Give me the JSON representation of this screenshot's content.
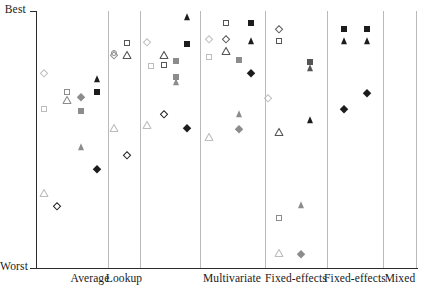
{
  "figure": {
    "type": "strip-plot",
    "background": "#ffffff"
  },
  "axes": {
    "y_top_label": "Best",
    "y_bottom_label": "Worst",
    "y_axis_note": "ordinal rank axis, no numeric ticks",
    "x_axis_note": "categorical panels"
  },
  "panels": [
    {
      "label": "Average"
    },
    {
      "label": "Lookup"
    },
    {
      "label": "Multivariate"
    },
    {
      "label": "Fixed-effects"
    },
    {
      "label": "Fixed-effects"
    },
    {
      "label": "Mixed"
    }
  ],
  "colors": {
    "black": "#1c1c1c",
    "dark_gray": "#555555",
    "mid_gray": "#8c8c8c",
    "light_gray": "#bdbdbd",
    "axis": "#2b2b2b",
    "divider": "#b9b9b9"
  },
  "chart_data": {
    "type": "scatter",
    "title": "",
    "xlabel": "",
    "ylabel": "",
    "ylim": [
      0,
      1
    ],
    "y_tick_labels": [
      "Best",
      "Worst"
    ],
    "y_tick_values": [
      1,
      0
    ],
    "grid": false,
    "legend": "none",
    "categories": [
      "Average",
      "Lookup",
      "Multivariate",
      "Fixed-effects",
      "Fixed-effects",
      "Mixed"
    ],
    "marker_shapes": [
      "diamond",
      "square",
      "triangle",
      "circle"
    ],
    "marker_fills": [
      "open",
      "filled"
    ],
    "note": "Each point is a method ranked from Best (top) to Worst (bottom) within a panel. x is jitter position inside the panel, y is rank score 0..1.",
    "points": [
      {
        "panel": "Average",
        "shape": "diamond",
        "fill": "open",
        "color": "light_gray",
        "x": 0.1,
        "y": 0.76
      },
      {
        "panel": "Average",
        "shape": "square",
        "fill": "open",
        "color": "mid_gray",
        "x": 0.42,
        "y": 0.684
      },
      {
        "panel": "Average",
        "shape": "triangle",
        "fill": "open",
        "color": "mid_gray",
        "x": 0.42,
        "y": 0.655
      },
      {
        "panel": "Average",
        "shape": "square",
        "fill": "open",
        "color": "light_gray",
        "x": 0.1,
        "y": 0.62
      },
      {
        "panel": "Average",
        "shape": "diamond",
        "fill": "filled",
        "color": "mid_gray",
        "x": 0.62,
        "y": 0.665
      },
      {
        "panel": "Average",
        "shape": "square",
        "fill": "filled",
        "color": "mid_gray",
        "x": 0.62,
        "y": 0.61
      },
      {
        "panel": "Average",
        "shape": "triangle",
        "fill": "filled",
        "color": "black",
        "x": 0.84,
        "y": 0.735
      },
      {
        "panel": "Average",
        "shape": "square",
        "fill": "filled",
        "color": "black",
        "x": 0.84,
        "y": 0.685
      },
      {
        "panel": "Average",
        "shape": "triangle",
        "fill": "filled",
        "color": "mid_gray",
        "x": 0.62,
        "y": 0.47
      },
      {
        "panel": "Average",
        "shape": "diamond",
        "fill": "filled",
        "color": "black",
        "x": 0.84,
        "y": 0.385
      },
      {
        "panel": "Average",
        "shape": "triangle",
        "fill": "open",
        "color": "light_gray",
        "x": 0.1,
        "y": 0.29
      },
      {
        "panel": "Average",
        "shape": "diamond",
        "fill": "open",
        "color": "black",
        "x": 0.28,
        "y": 0.24
      },
      {
        "panel": "Lookup",
        "shape": "circle",
        "fill": "open",
        "color": "mid_gray",
        "x": 0.18,
        "y": 0.835
      },
      {
        "panel": "Lookup",
        "shape": "diamond",
        "fill": "open",
        "color": "mid_gray",
        "x": 0.18,
        "y": 0.83
      },
      {
        "panel": "Lookup",
        "shape": "square",
        "fill": "open",
        "color": "dark_gray",
        "x": 0.6,
        "y": 0.875
      },
      {
        "panel": "Lookup",
        "shape": "triangle",
        "fill": "open",
        "color": "dark_gray",
        "x": 0.6,
        "y": 0.828
      },
      {
        "panel": "Lookup",
        "shape": "triangle",
        "fill": "open",
        "color": "light_gray",
        "x": 0.18,
        "y": 0.545
      },
      {
        "panel": "Lookup",
        "shape": "diamond",
        "fill": "open",
        "color": "black",
        "x": 0.6,
        "y": 0.44
      },
      {
        "panel": "Multivariate",
        "shape": "triangle",
        "fill": "filled",
        "color": "black",
        "x": 0.78,
        "y": 0.975
      },
      {
        "panel": "Multivariate",
        "shape": "diamond",
        "fill": "open",
        "color": "light_gray",
        "x": 0.12,
        "y": 0.88
      },
      {
        "panel": "Multivariate",
        "shape": "triangle",
        "fill": "open",
        "color": "dark_gray",
        "x": 0.4,
        "y": 0.83
      },
      {
        "panel": "Multivariate",
        "shape": "square",
        "fill": "filled",
        "color": "black",
        "x": 0.78,
        "y": 0.87
      },
      {
        "panel": "Multivariate",
        "shape": "square",
        "fill": "open",
        "color": "dark_gray",
        "x": 0.4,
        "y": 0.79
      },
      {
        "panel": "Multivariate",
        "shape": "square",
        "fill": "filled",
        "color": "mid_gray",
        "x": 0.6,
        "y": 0.805
      },
      {
        "panel": "Multivariate",
        "shape": "square",
        "fill": "open",
        "color": "light_gray",
        "x": 0.18,
        "y": 0.785
      },
      {
        "panel": "Multivariate",
        "shape": "square",
        "fill": "filled",
        "color": "mid_gray",
        "x": 0.6,
        "y": 0.745
      },
      {
        "panel": "Multivariate",
        "shape": "triangle",
        "fill": "filled",
        "color": "mid_gray",
        "x": 0.6,
        "y": 0.725
      },
      {
        "panel": "Multivariate",
        "shape": "diamond",
        "fill": "open",
        "color": "black",
        "x": 0.4,
        "y": 0.6
      },
      {
        "panel": "Multivariate",
        "shape": "triangle",
        "fill": "open",
        "color": "light_gray",
        "x": 0.12,
        "y": 0.555
      },
      {
        "panel": "Multivariate",
        "shape": "diamond",
        "fill": "filled",
        "color": "black",
        "x": 0.78,
        "y": 0.545
      },
      {
        "panel": "Fixed-effects",
        "shape": "square",
        "fill": "open",
        "color": "dark_gray",
        "x": 0.4,
        "y": 0.955
      },
      {
        "panel": "Fixed-effects",
        "shape": "square",
        "fill": "filled",
        "color": "black",
        "x": 0.78,
        "y": 0.955
      },
      {
        "panel": "Fixed-effects",
        "shape": "diamond",
        "fill": "open",
        "color": "light_gray",
        "x": 0.14,
        "y": 0.89
      },
      {
        "panel": "Fixed-effects",
        "shape": "diamond",
        "fill": "open",
        "color": "dark_gray",
        "x": 0.4,
        "y": 0.89
      },
      {
        "panel": "Fixed-effects",
        "shape": "triangle",
        "fill": "filled",
        "color": "black",
        "x": 0.78,
        "y": 0.885
      },
      {
        "panel": "Fixed-effects",
        "shape": "triangle",
        "fill": "open",
        "color": "dark_gray",
        "x": 0.4,
        "y": 0.845
      },
      {
        "panel": "Fixed-effects",
        "shape": "square",
        "fill": "open",
        "color": "light_gray",
        "x": 0.14,
        "y": 0.82
      },
      {
        "panel": "Fixed-effects",
        "shape": "square",
        "fill": "filled",
        "color": "mid_gray",
        "x": 0.6,
        "y": 0.81
      },
      {
        "panel": "Fixed-effects",
        "shape": "diamond",
        "fill": "filled",
        "color": "black",
        "x": 0.78,
        "y": 0.76
      },
      {
        "panel": "Fixed-effects",
        "shape": "triangle",
        "fill": "filled",
        "color": "mid_gray",
        "x": 0.6,
        "y": 0.6
      },
      {
        "panel": "Fixed-effects",
        "shape": "diamond",
        "fill": "filled",
        "color": "mid_gray",
        "x": 0.6,
        "y": 0.54
      },
      {
        "panel": "Fixed-effects",
        "shape": "triangle",
        "fill": "open",
        "color": "light_gray",
        "x": 0.14,
        "y": 0.51
      },
      {
        "panel": "Fixed-effects-2",
        "shape": "diamond",
        "fill": "open",
        "color": "dark_gray",
        "x": 0.22,
        "y": 0.93
      },
      {
        "panel": "Fixed-effects-2",
        "shape": "square",
        "fill": "open",
        "color": "dark_gray",
        "x": 0.22,
        "y": 0.885
      },
      {
        "panel": "Fixed-effects-2",
        "shape": "square",
        "fill": "filled",
        "color": "dark_gray",
        "x": 0.72,
        "y": 0.8
      },
      {
        "panel": "Fixed-effects-2",
        "shape": "triangle",
        "fill": "filled",
        "color": "dark_gray",
        "x": 0.72,
        "y": 0.78
      },
      {
        "panel": "Fixed-effects-2",
        "shape": "diamond",
        "fill": "open",
        "color": "light_gray",
        "x": 0.05,
        "y": 0.66
      },
      {
        "panel": "Fixed-effects-2",
        "shape": "triangle",
        "fill": "filled",
        "color": "black",
        "x": 0.72,
        "y": 0.575
      },
      {
        "panel": "Fixed-effects-2",
        "shape": "triangle",
        "fill": "open",
        "color": "dark_gray",
        "x": 0.22,
        "y": 0.53
      },
      {
        "panel": "Fixed-effects-2",
        "shape": "triangle",
        "fill": "filled",
        "color": "mid_gray",
        "x": 0.58,
        "y": 0.245
      },
      {
        "panel": "Fixed-effects-2",
        "shape": "square",
        "fill": "open",
        "color": "mid_gray",
        "x": 0.22,
        "y": 0.195
      },
      {
        "panel": "Fixed-effects-2",
        "shape": "triangle",
        "fill": "open",
        "color": "light_gray",
        "x": 0.22,
        "y": 0.06
      },
      {
        "panel": "Fixed-effects-2",
        "shape": "diamond",
        "fill": "filled",
        "color": "mid_gray",
        "x": 0.58,
        "y": 0.055
      },
      {
        "panel": "Mixed",
        "shape": "square",
        "fill": "filled",
        "color": "black",
        "x": 0.3,
        "y": 0.93
      },
      {
        "panel": "Mixed",
        "shape": "square",
        "fill": "filled",
        "color": "black",
        "x": 0.72,
        "y": 0.93
      },
      {
        "panel": "Mixed",
        "shape": "triangle",
        "fill": "filled",
        "color": "black",
        "x": 0.3,
        "y": 0.885
      },
      {
        "panel": "Mixed",
        "shape": "triangle",
        "fill": "filled",
        "color": "black",
        "x": 0.72,
        "y": 0.885
      },
      {
        "panel": "Mixed",
        "shape": "diamond",
        "fill": "filled",
        "color": "black",
        "x": 0.72,
        "y": 0.68
      },
      {
        "panel": "Mixed",
        "shape": "diamond",
        "fill": "filled",
        "color": "black",
        "x": 0.3,
        "y": 0.62
      }
    ]
  },
  "geometry": {
    "plot_left": 37,
    "plot_right": 417,
    "plot_top": 11,
    "plot_bottom": 268,
    "panel_edges": [
      37,
      108,
      140,
      200,
      265,
      327,
      383,
      417
    ],
    "label_centers": [
      90,
      124,
      232,
      296,
      355,
      400
    ]
  }
}
